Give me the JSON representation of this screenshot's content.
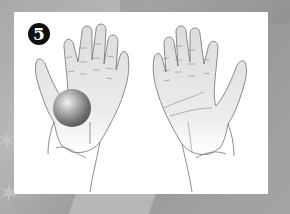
{
  "step": {
    "number": "5"
  },
  "illustration": {
    "left_hand": "open palm holding ball",
    "right_hand": "open empty palm",
    "ball_color": "#8a8a8a"
  },
  "colors": {
    "panel": "#ffffff",
    "background": "#a6a6a6",
    "badge": "#111111",
    "outline": "#6e6e6e",
    "skin_shade": "#e2e2e2"
  }
}
